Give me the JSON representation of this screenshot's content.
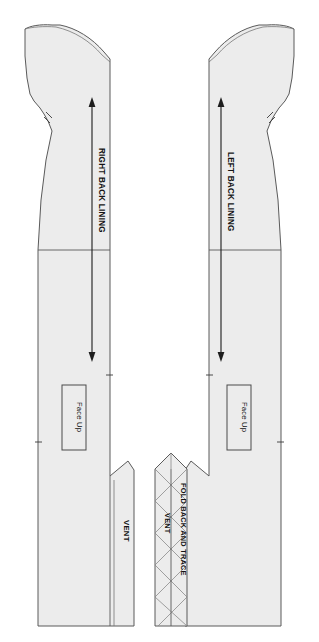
{
  "document": {
    "kind": "sewing-pattern-sheet",
    "background_color": "#ffffff",
    "piece_fill_color": "#ececec",
    "piece_outline_color": "#5a5a5a",
    "text_color": "#141414"
  },
  "pieces": {
    "right_back_lining": {
      "grainline_label": "RIGHT BACK LINING",
      "face_up_label": "Face Up",
      "vent_label": "VENT"
    },
    "left_back_lining": {
      "grainline_label": "LEFT BACK LINING",
      "face_up_label": "Face Up"
    },
    "center_vent": {
      "fold_label": "FOLD BACK AND TRACE",
      "vent_label": "VENT"
    }
  }
}
